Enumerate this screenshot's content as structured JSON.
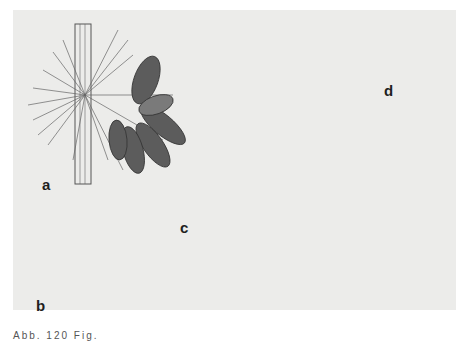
{
  "figure": {
    "background": "#ececea",
    "ink_color": "#3a3a3a",
    "spore_dark": "#5a5a5a",
    "spore_light": "#9a9a9a",
    "panels": [
      {
        "id": "a",
        "label": "a",
        "description": "cluster of dark multi-septate conidia among hyphae on a stem"
      },
      {
        "id": "b",
        "label": "b",
        "description": "two fusiform septate conidia"
      },
      {
        "id": "c",
        "label": "c",
        "description": "germinating conidia with branching hyphae and swollen cells"
      },
      {
        "id": "d",
        "label": "d",
        "description": "conidium with long septate germ tube"
      }
    ],
    "caption": "Abb. 120  Fig."
  }
}
